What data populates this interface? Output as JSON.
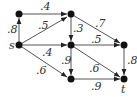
{
  "diagram": {
    "type": "directed-graph",
    "nodes": [
      {
        "id": "a",
        "label": "",
        "x": 19,
        "y": 14
      },
      {
        "id": "b",
        "label": "",
        "x": 71,
        "y": 14
      },
      {
        "id": "s",
        "label": "s",
        "x": 19,
        "y": 45
      },
      {
        "id": "c",
        "label": "",
        "x": 71,
        "y": 45
      },
      {
        "id": "d",
        "label": "",
        "x": 124,
        "y": 45
      },
      {
        "id": "e",
        "label": "",
        "x": 71,
        "y": 79
      },
      {
        "id": "t",
        "label": "t",
        "x": 124,
        "y": 79
      }
    ],
    "edges": [
      {
        "from": "s",
        "to": "a",
        "weight": ".8"
      },
      {
        "from": "a",
        "to": "b",
        "weight": ".4"
      },
      {
        "from": "s",
        "to": "b",
        "weight": ".5"
      },
      {
        "from": "b",
        "to": "c",
        "weight": ".3"
      },
      {
        "from": "b",
        "to": "d",
        "weight": ".7"
      },
      {
        "from": "s",
        "to": "c",
        "weight": ".4"
      },
      {
        "from": "c",
        "to": "d",
        "weight": ".5"
      },
      {
        "from": "c",
        "to": "e",
        "weight": ".9"
      },
      {
        "from": "c",
        "to": "t",
        "weight": ".6"
      },
      {
        "from": "d",
        "to": "t",
        "weight": ".8"
      },
      {
        "from": "s",
        "to": "e",
        "weight": ".6"
      },
      {
        "from": "e",
        "to": "t",
        "weight": ".9"
      }
    ]
  }
}
